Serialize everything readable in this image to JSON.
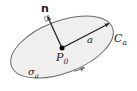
{
  "figure": {
    "kind": "geometry-diagram",
    "canvas": {
      "width": 137,
      "height": 91,
      "background": "#ffffff"
    },
    "colors": {
      "surface_fill": "#f0efee",
      "surface_stroke": "#6b6b6b",
      "vector_stroke": "#1a1a1a",
      "point_fill": "#000000",
      "label_color": "#1a1a1a"
    },
    "labels": {
      "normal": "n",
      "radius_vector": "a",
      "boundary_curve": "C",
      "boundary_curve_sub": "a",
      "center_point": "P",
      "center_point_sub": "0",
      "surface": "σ",
      "surface_sub": "a"
    },
    "elements": {
      "surface_ellipse": {
        "center_x": 62,
        "center_y": 47,
        "radius_x": 54,
        "radius_y": 26,
        "rotation_deg": -21
      },
      "center_point": {
        "x": 62,
        "y": 48,
        "radius": 2.4
      },
      "normal_vector": {
        "from_x": 62,
        "from_y": 48,
        "to_x": 47,
        "to_y": 15
      },
      "radius_vector": {
        "from_x": 62,
        "from_y": 48,
        "to_x": 110,
        "to_y": 23
      },
      "right_angle_marker": {
        "x": 47,
        "y": 16,
        "size": 5
      },
      "orientation_arrow": {
        "x": 84,
        "y": 68,
        "direction_deg": -38
      }
    }
  }
}
